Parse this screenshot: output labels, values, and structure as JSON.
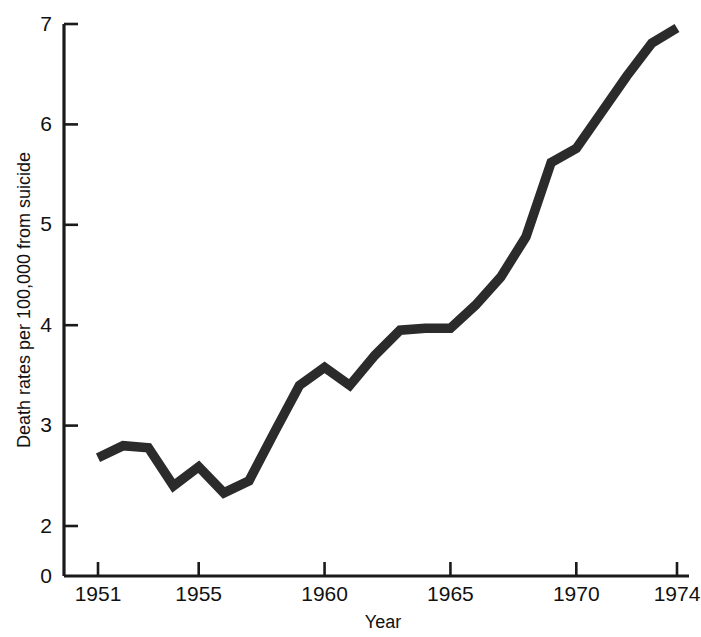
{
  "chart_data": {
    "type": "line",
    "title": "",
    "xlabel": "Year",
    "ylabel": "Death rates per 100,000 from suicide",
    "x": [
      1951,
      1952,
      1953,
      1954,
      1955,
      1956,
      1957,
      1958,
      1959,
      1960,
      1961,
      1962,
      1963,
      1964,
      1965,
      1966,
      1967,
      1968,
      1969,
      1970,
      1971,
      1972,
      1973,
      1974
    ],
    "values": [
      2.68,
      2.8,
      2.78,
      2.4,
      2.59,
      2.33,
      2.45,
      2.93,
      3.4,
      3.58,
      3.4,
      3.7,
      3.95,
      3.97,
      3.97,
      4.2,
      4.48,
      4.88,
      5.62,
      5.76,
      6.12,
      6.48,
      6.81,
      6.96
    ],
    "series": [
      {
        "name": "Suicide death rate",
        "values": [
          2.68,
          2.8,
          2.78,
          2.4,
          2.59,
          2.33,
          2.45,
          2.93,
          3.4,
          3.58,
          3.4,
          3.7,
          3.95,
          3.97,
          3.97,
          4.2,
          4.48,
          4.88,
          5.62,
          5.76,
          6.12,
          6.48,
          6.81,
          6.96
        ]
      }
    ],
    "xlim": [
      1951,
      1974
    ],
    "ylim": [
      2,
      7
    ],
    "y_axis_break_at_zero": true,
    "yticks": [
      0,
      2,
      3,
      4,
      5,
      6,
      7
    ],
    "ytick_labels": [
      "0",
      "2",
      "3",
      "4",
      "5",
      "6",
      "7"
    ],
    "xticks": [
      1951,
      1955,
      1960,
      1965,
      1970,
      1974
    ],
    "xtick_labels": [
      "1951",
      "1955",
      "1960",
      "1965",
      "1970",
      "1974"
    ],
    "grid": false,
    "legend": "none",
    "line_color": "#2b2b2b",
    "background_color": "#ffffff"
  }
}
